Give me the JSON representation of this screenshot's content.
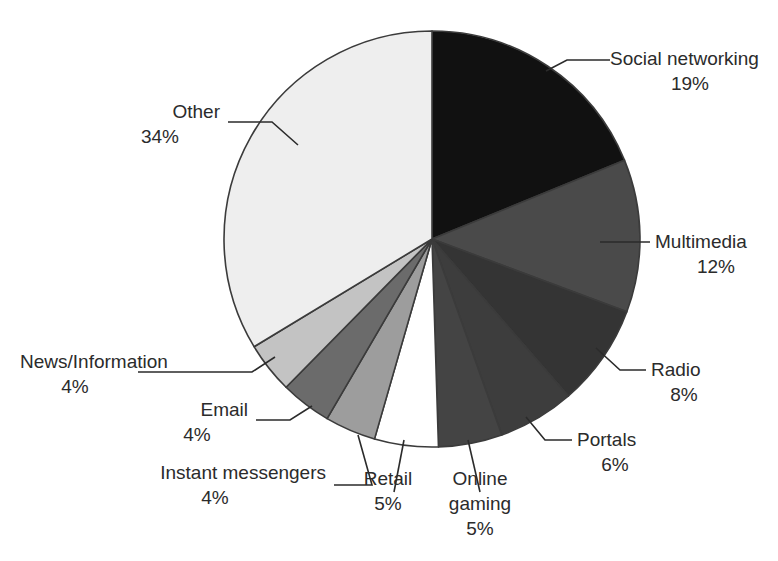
{
  "chart_data": {
    "type": "pie",
    "title": "",
    "subtitle": "",
    "xlabel": "",
    "ylabel": "",
    "legend_position": "none",
    "grid": false,
    "value_unit": "%",
    "start_angle_deg": 0,
    "direction": "clockwise",
    "center": {
      "x": 432,
      "y": 239
    },
    "radius": 208,
    "categories": [
      "Social networking",
      "Multimedia",
      "Radio",
      "Portals",
      "Online gaming",
      "Retail",
      "Instant messengers",
      "Email",
      "News/Information",
      "Other"
    ],
    "values": [
      19,
      12,
      8,
      6,
      5,
      5,
      4,
      4,
      4,
      34
    ],
    "colors": [
      "#111111",
      "#4a4a4a",
      "#343434",
      "#3d3d3d",
      "#444444",
      "#ffffff",
      "#9d9d9d",
      "#6b6b6b",
      "#c3c3c3",
      "#eeeeee"
    ],
    "slice_stroke": "#3b3b3b",
    "slices": [
      {
        "label": "Social networking",
        "value": 19,
        "value_text": "19%",
        "color": "#111111"
      },
      {
        "label": "Multimedia",
        "value": 12,
        "value_text": "12%",
        "color": "#4a4a4a"
      },
      {
        "label": "Radio",
        "value": 8,
        "value_text": "8%",
        "color": "#343434"
      },
      {
        "label": "Portals",
        "value": 6,
        "value_text": "6%",
        "color": "#3d3d3d"
      },
      {
        "label": "Online gaming",
        "value": 5,
        "value_text": "5%",
        "color": "#444444"
      },
      {
        "label": "Retail",
        "value": 5,
        "value_text": "5%",
        "color": "#ffffff"
      },
      {
        "label": "Instant messengers",
        "value": 4,
        "value_text": "4%",
        "color": "#9d9d9d"
      },
      {
        "label": "Email",
        "value": 4,
        "value_text": "4%",
        "color": "#6b6b6b"
      },
      {
        "label": "News/Information",
        "value": 4,
        "value_text": "4%",
        "color": "#c3c3c3"
      },
      {
        "label": "Other",
        "value": 34,
        "value_text": "34%",
        "color": "#eeeeee"
      }
    ]
  },
  "labels": {
    "social_networking": {
      "name": "Social networking",
      "percent": "19%"
    },
    "multimedia": {
      "name": "Multimedia",
      "percent": "12%"
    },
    "radio": {
      "name": "Radio",
      "percent": "8%"
    },
    "portals": {
      "name": "Portals",
      "percent": "6%"
    },
    "online_gaming": {
      "name_line1": "Online",
      "name_line2": "gaming",
      "percent": "5%"
    },
    "retail": {
      "name": "Retail",
      "percent": "5%"
    },
    "instant_messengers": {
      "name": "Instant messengers",
      "percent": "4%"
    },
    "email": {
      "name": "Email",
      "percent": "4%"
    },
    "news_information": {
      "name": "News/Information",
      "percent": "4%"
    },
    "other": {
      "name": "Other",
      "percent": "34%"
    }
  }
}
